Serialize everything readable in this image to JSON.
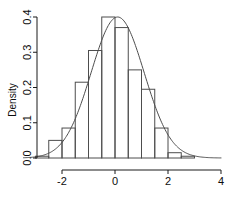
{
  "chart_data": {
    "type": "bar",
    "title": "",
    "subtitle": "",
    "xlabel": "",
    "ylabel": "Density",
    "xlim": [
      -3.45,
      4.0
    ],
    "ylim": [
      0.0,
      0.415
    ],
    "grid": false,
    "legend": null,
    "bin_width": 0.5,
    "bin_edges": [
      -3.0,
      -2.5,
      -2.0,
      -1.5,
      -1.0,
      -0.5,
      0.0,
      0.5,
      1.0,
      1.5,
      2.0,
      2.5,
      3.0
    ],
    "categories": [
      "-3.0 to -2.5",
      "-2.5 to -2.0",
      "-2.0 to -1.5",
      "-1.5 to -1.0",
      "-1.0 to -0.5",
      "-0.5 to 0.0",
      "0.0 to 0.5",
      "0.5 to 1.0",
      "1.0 to 1.5",
      "1.5 to 2.0",
      "2.0 to 2.5",
      "2.5 to 3.0"
    ],
    "values": [
      0.005,
      0.05,
      0.085,
      0.215,
      0.305,
      0.4,
      0.37,
      0.25,
      0.195,
      0.085,
      0.015,
      0.005
    ],
    "xticks": [
      -2,
      0,
      2,
      4
    ],
    "xtick_labels": [
      "-2",
      "0",
      "2",
      "4"
    ],
    "yticks": [
      0.0,
      0.1,
      0.2,
      0.3,
      0.4
    ],
    "ytick_labels": [
      "0.0",
      "0.1",
      "0.2",
      "0.3",
      "0.4"
    ],
    "overlay": {
      "name": "normal-density-curve",
      "type": "line",
      "mean": 0.1,
      "sd": 1.0,
      "peak_value": 0.4
    },
    "colors": {
      "bar_stroke": "#4d4d4d",
      "bar_fill": "none",
      "curve": "#4d4d4d",
      "axis": "#1a1a1a",
      "text": "#0d0d0d"
    }
  }
}
